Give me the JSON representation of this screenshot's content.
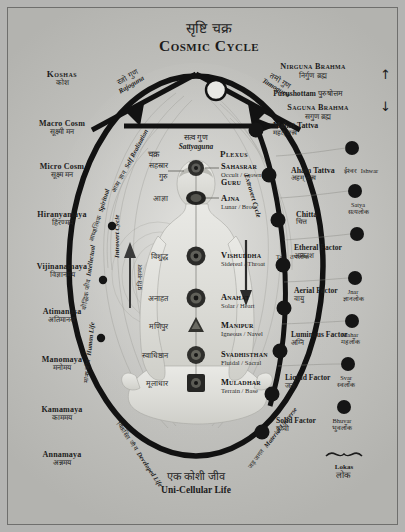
{
  "title": {
    "hindi": "सृष्टि चक्र",
    "english": "Cosmic Cycle"
  },
  "top_right": {
    "nirguna_en": "Nirguna Brahma",
    "nirguna_hi": "निर्गुण ब्रह्म",
    "purushottam_en": "Purushottam",
    "purushottam_hi": "पुरुषोत्तम",
    "saguna_en": "Saguna Brahma",
    "saguna_hi": "सगुण ब्रह्म",
    "arrow_up": "↑",
    "arrow_down": "↓"
  },
  "koshas": {
    "heading_en": "Koshas",
    "heading_hi": "कोश",
    "items": [
      {
        "en": "Macro Cosm",
        "hi": "सूक्ष्मी मन"
      },
      {
        "en": "Micro Cosm",
        "hi": "सूक्ष्म मन"
      },
      {
        "en": "Hiranyamaya",
        "hi": "हिरण्मय"
      },
      {
        "en": "Vijinanamaya",
        "hi": "विज्ञानमय"
      },
      {
        "en": "Atimanasa",
        "hi": "अतिमानस"
      },
      {
        "en": "Manomaya",
        "hi": "मनोमय"
      },
      {
        "en": "Kamamaya",
        "hi": "काममय"
      },
      {
        "en": "Annamaya",
        "hi": "अन्नमय"
      }
    ]
  },
  "gunas": [
    {
      "hi": "रजो गुण",
      "en": "Rajoguna"
    },
    {
      "hi": "तमो गुण",
      "en": "Tamoguna"
    },
    {
      "hi": "सत्व गुण",
      "en": "Sattyaguna"
    }
  ],
  "plexus_header": {
    "hi": "चक्र",
    "en": "Plexus"
  },
  "chakras": [
    {
      "hi": "सहस्रार",
      "hi2": "गुरु",
      "en": "Sahasrar",
      "sub": "Occult / Crown",
      "sub2": "Guru"
    },
    {
      "hi": "आज्ञा",
      "en": "Ajna",
      "sub": "Lunar / Brow"
    },
    {
      "hi": "विशुद्ध",
      "en": "Vishuddha",
      "sub": "Sidereal / Throat"
    },
    {
      "hi": "अनाहत",
      "en": "Anahat",
      "sub": "Solar / Heart"
    },
    {
      "hi": "मणिपुर",
      "en": "Manipur",
      "sub": "Igneous / Navel"
    },
    {
      "hi": "स्वाधिष्ठान",
      "en": "Svadhisthan",
      "sub": "Fluidal / Sacral"
    },
    {
      "hi": "मूलाधार",
      "en": "Muladhar",
      "sub": "Terrain / Base"
    }
  ],
  "tattvas": [
    {
      "en": "Mahat Tattva",
      "hi": "महत् तत्त्व"
    },
    {
      "en": "Aham Tattva",
      "hi": "अहम् तत्त्व"
    },
    {
      "en": "Chitta",
      "hi": "चित्त"
    }
  ],
  "factors": [
    {
      "en": "Etheral Factor",
      "hi": "आकाश"
    },
    {
      "en": "Aerial Factor",
      "hi": "वायु"
    },
    {
      "en": "Luminous Factor",
      "hi": "अग्नि"
    },
    {
      "en": "Liquid Factor",
      "hi": "जल"
    },
    {
      "en": "Solid Factor",
      "hi": "पृथ्वी"
    }
  ],
  "lokas": {
    "label_en": "Lokas",
    "label_hi": "लोक",
    "items": [
      {
        "en": "Ishwar",
        "hi": "ईश्वर"
      },
      {
        "en": "Satya",
        "hi": "सत्यलोक"
      },
      {
        "en": "Tap",
        "hi": "तपलोक"
      },
      {
        "en": "Jnar",
        "hi": "ज्ञानलोक"
      },
      {
        "en": "Mahar",
        "hi": "महर्लोक"
      },
      {
        "en": "Svar",
        "hi": "स्वर्लोक"
      },
      {
        "en": "Bhuvar",
        "hi": "भुवर्लोक"
      }
    ]
  },
  "cycles": {
    "introvert": "Introvert Cycle",
    "extrovert": "Extrovert Cycle",
    "self_realization_en": "Self Realization",
    "self_realization_hi": "आत्म ज्ञान",
    "spiritual_en": "Spiritual",
    "spiritual_hi": "आध्यात्मिक",
    "intellectual_en": "Intellectual",
    "intellectual_hi": "बौद्धिक जीव",
    "human_en": "Human Life",
    "human_hi": "मानव जीव",
    "developed_en": "Developed Life",
    "developed_hi": "विकसित जीव",
    "material_en": "Material Universe",
    "material_hi": "जड़ जगत",
    "pratisancara_hi": "प्रति-सञ्चर"
  },
  "bottom": {
    "hi": "एक कोशी जीव",
    "en": "Uni-Cellular Life"
  },
  "colors": {
    "ink": "#141414",
    "bg": "#c6c6c3",
    "node": "#1a1a1a"
  }
}
